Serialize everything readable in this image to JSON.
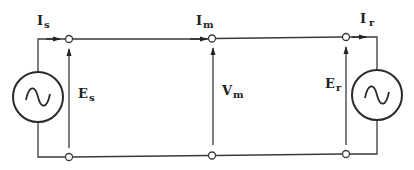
{
  "diagram": {
    "type": "transmission-line-circuit",
    "labels": {
      "sending_current": {
        "main": "I",
        "sub": "s"
      },
      "mid_current": {
        "main": "I",
        "sub": "m"
      },
      "receiving_current": {
        "main": "I",
        "sub": "r"
      },
      "sending_voltage": {
        "main": "E",
        "sub": "s"
      },
      "mid_voltage": {
        "main": "V",
        "sub": "m"
      },
      "receiving_voltage": {
        "main": "E",
        "sub": "r"
      }
    },
    "sources": [
      "sending-ac-source",
      "receiving-ac-source"
    ],
    "terminals": [
      "sending-end",
      "midpoint",
      "receiving-end"
    ]
  }
}
